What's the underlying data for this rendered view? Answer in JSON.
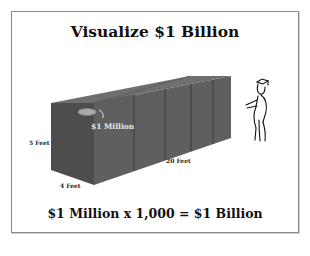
{
  "slide": {
    "title": "Visualize $1 Billion",
    "equation": "$1 Million x 1,000 = $1 Billion"
  },
  "illustration": {
    "cube_label": "$1 Million",
    "height_label": "5 Feet",
    "width_label": "4 Feet",
    "length_label": "20 Feet",
    "segments": 5,
    "block_color": "#5a5a5a",
    "figure": "graduate-stick-figure"
  }
}
